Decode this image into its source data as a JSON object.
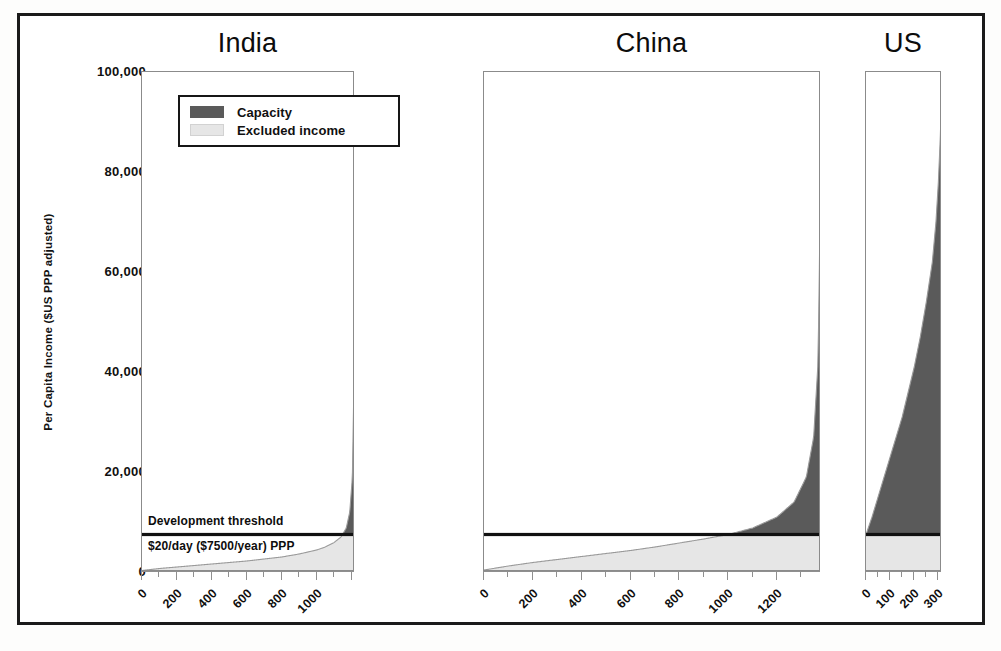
{
  "figure": {
    "ylabel": "Per Capita Income ($US PPP adjusted)",
    "yticks": [
      "0",
      "20,000",
      "40,000",
      "60,000",
      "80,000",
      "100,000"
    ],
    "ylim": [
      0,
      100000
    ]
  },
  "legend": {
    "items": [
      {
        "label": "Capacity",
        "color": "#5a5a5a"
      },
      {
        "label": "Excluded income",
        "color": "#e6e6e6"
      }
    ]
  },
  "annotations": {
    "threshold_label": "Development threshold",
    "threshold_value_label": "$20/day ($7500/year) PPP",
    "threshold_value": 7500
  },
  "panels": [
    {
      "title": "India",
      "xticks": [
        "0",
        "200",
        "400",
        "600",
        "800",
        "1000"
      ],
      "xlim": [
        0,
        1220
      ],
      "population_millions": 1220
    },
    {
      "title": "China",
      "xticks": [
        "0",
        "200",
        "400",
        "600",
        "800",
        "1000",
        "1200"
      ],
      "xlim": [
        0,
        1380
      ],
      "population_millions": 1380
    },
    {
      "title": "US",
      "xticks": [
        "0",
        "100",
        "200",
        "300"
      ],
      "xlim": [
        0,
        315
      ],
      "population_millions": 315
    }
  ],
  "chart_data": {
    "type": "area",
    "title": "",
    "xlabel": "Cumulative population (millions), sorted by income",
    "ylabel": "Per Capita Income ($US PPP adjusted)",
    "ylim": [
      0,
      100000
    ],
    "grid": false,
    "legend_position": "upper-left-panel-1",
    "threshold": 7500,
    "threshold_labels": [
      "Development threshold",
      "$20/day ($7500/year) PPP"
    ],
    "series_description": "For each country, cumulative population (sorted poorest to richest) on x; per-capita income on y. Light gray = Excluded income (area under income curve below the $7500 threshold). Dark gray = Capacity (area under income curve above the threshold).",
    "panels": [
      {
        "name": "India",
        "x": [
          0,
          100,
          200,
          300,
          400,
          500,
          600,
          700,
          800,
          900,
          1000,
          1050,
          1100,
          1140,
          1170,
          1190,
          1205,
          1215,
          1220
        ],
        "income": [
          300,
          700,
          1000,
          1300,
          1600,
          1900,
          2200,
          2600,
          3000,
          3600,
          4400,
          5000,
          5900,
          7000,
          8800,
          12000,
          19000,
          40000,
          100000
        ],
        "capacity_start_x": 1150,
        "capacity_area_note": "thin dark spike hugging right edge, reaching top of axis"
      },
      {
        "name": "China",
        "x": [
          0,
          100,
          200,
          300,
          400,
          500,
          600,
          700,
          800,
          900,
          1000,
          1100,
          1200,
          1270,
          1320,
          1350,
          1368,
          1376,
          1380
        ],
        "income": [
          400,
          1200,
          1900,
          2500,
          3100,
          3700,
          4300,
          5000,
          5800,
          6600,
          7500,
          8800,
          11000,
          14000,
          19000,
          27000,
          42000,
          70000,
          100000
        ],
        "capacity_start_x": 1000,
        "capacity_area_note": "dark area grows from threshold crossing near x=1000 and climbs steeply to top at right edge"
      },
      {
        "name": "US",
        "x": [
          0,
          25,
          50,
          75,
          100,
          125,
          150,
          175,
          200,
          225,
          250,
          275,
          290,
          300,
          308,
          313,
          315
        ],
        "income": [
          7500,
          11000,
          15000,
          19000,
          23000,
          27000,
          31000,
          36000,
          41000,
          47000,
          54000,
          62000,
          70000,
          78000,
          87000,
          95000,
          100000
        ],
        "capacity_start_x": 0,
        "capacity_area_note": "entire population above threshold; wide dark wedge from baseline rising to top of axis"
      }
    ]
  }
}
